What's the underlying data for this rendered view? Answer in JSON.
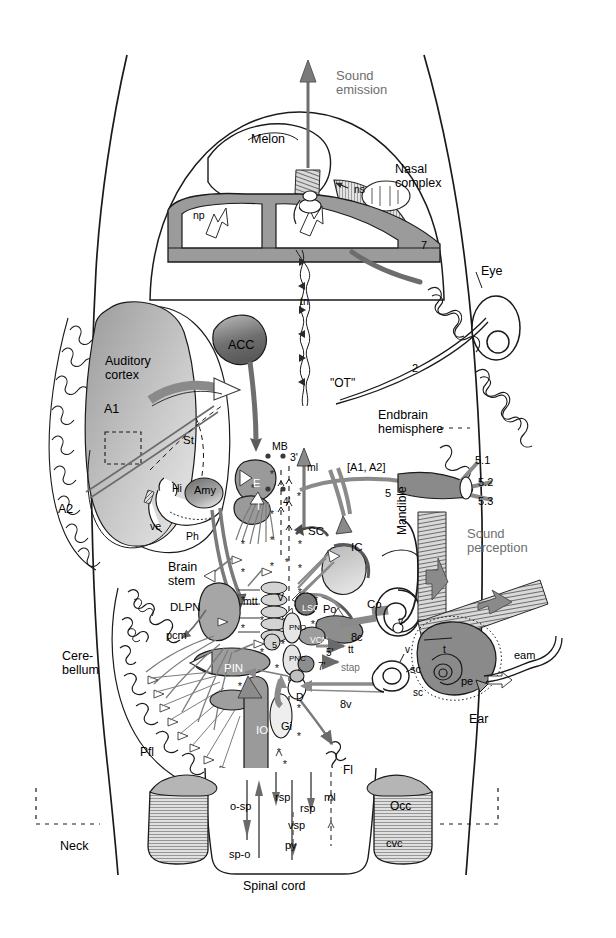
{
  "figure": {
    "domain": "diagram",
    "background_color": "#ffffff",
    "line_color": "#1a1a1a",
    "fill_mid": "#8f8f8f",
    "fill_light": "#c9c9c9",
    "fill_dark": "#5d5d5d",
    "gray_text": "#6e6e6e"
  },
  "callouts": {
    "sound_emission": "Sound\nemission",
    "sound_perception": "Sound\nperception"
  },
  "anatomy_labels": [
    {
      "id": "melon",
      "text": "Melon",
      "x": 251,
      "y": 133,
      "size": 12.5,
      "color": "#000000"
    },
    {
      "id": "nasal-complex",
      "text": "Nasal\ncomplex",
      "x": 395,
      "y": 163,
      "size": 12.5,
      "color": "#000000"
    },
    {
      "id": "ns",
      "text": "ns",
      "x": 354,
      "y": 184,
      "size": 10.5,
      "color": "#000000"
    },
    {
      "id": "np",
      "text": "np",
      "x": 193,
      "y": 210,
      "size": 10.5,
      "color": "#000000"
    },
    {
      "id": "nerve-7",
      "text": "7",
      "x": 421,
      "y": 240,
      "size": 11,
      "color": "#000000"
    },
    {
      "id": "eye",
      "text": "Eye",
      "x": 481,
      "y": 265,
      "size": 12.5,
      "color": "#000000"
    },
    {
      "id": "tn",
      "text": "tn",
      "x": 300,
      "y": 296,
      "size": 10.5,
      "color": "#000000"
    },
    {
      "id": "auditory-cortex",
      "text": "Auditory\ncortex",
      "x": 105,
      "y": 355,
      "size": 12.5,
      "color": "#000000"
    },
    {
      "id": "acc",
      "text": "ACC",
      "x": 228,
      "y": 339,
      "size": 12.5,
      "color": "#000000"
    },
    {
      "id": "a1",
      "text": "A1",
      "x": 104,
      "y": 403,
      "size": 12.5,
      "color": "#000000"
    },
    {
      "id": "st",
      "text": "St",
      "x": 183,
      "y": 434,
      "size": 11.5,
      "color": "#000000"
    },
    {
      "id": "ot",
      "text": "\"OT\"",
      "x": 330,
      "y": 377,
      "size": 12,
      "color": "#000000"
    },
    {
      "id": "nerve-2",
      "text": "2",
      "x": 412,
      "y": 363,
      "size": 11,
      "color": "#000000"
    },
    {
      "id": "endbrain",
      "text": "Endbrain\nhemisphere",
      "x": 378,
      "y": 409,
      "size": 12.5,
      "color": "#000000"
    },
    {
      "id": "a2",
      "text": "A2",
      "x": 58,
      "y": 503,
      "size": 12.5,
      "color": "#000000"
    },
    {
      "id": "hi",
      "text": "Hi",
      "x": 172,
      "y": 483,
      "size": 10.5,
      "color": "#000000"
    },
    {
      "id": "amy",
      "text": "Amy",
      "x": 194,
      "y": 485,
      "size": 11,
      "color": "#000000"
    },
    {
      "id": "ve",
      "text": "ve",
      "x": 150,
      "y": 521,
      "size": 10.5,
      "color": "#000000"
    },
    {
      "id": "ph",
      "text": "Ph",
      "x": 186,
      "y": 531,
      "size": 10.5,
      "color": "#000000"
    },
    {
      "id": "mb",
      "text": "MB",
      "x": 272,
      "y": 441,
      "size": 10.5,
      "color": "#000000"
    },
    {
      "id": "three-prime",
      "text": "3'",
      "x": 290,
      "y": 452,
      "size": 10.5,
      "color": "#000000"
    },
    {
      "id": "ml-top",
      "text": "ml",
      "x": 307,
      "y": 462,
      "size": 10.5,
      "color": "#000000"
    },
    {
      "id": "a1a2-bracket",
      "text": "[A1, A2]",
      "x": 347,
      "y": 462,
      "size": 11,
      "color": "#000000"
    },
    {
      "id": "nerve-5",
      "text": "5",
      "x": 385,
      "y": 488,
      "size": 11,
      "color": "#000000"
    },
    {
      "id": "nerve-5-1",
      "text": "5.1",
      "x": 475,
      "y": 455,
      "size": 11,
      "color": "#000000"
    },
    {
      "id": "nerve-5-2",
      "text": "5.2",
      "x": 478,
      "y": 477,
      "size": 11,
      "color": "#000000"
    },
    {
      "id": "nerve-5-3",
      "text": "5.3",
      "x": 478,
      "y": 496,
      "size": 11,
      "color": "#000000"
    },
    {
      "id": "e-nucleus",
      "text": "E",
      "x": 253,
      "y": 478,
      "size": 11,
      "color": "#ffffff"
    },
    {
      "id": "i-nucleus",
      "text": "I",
      "x": 257,
      "y": 501,
      "size": 11,
      "color": "#ffffff"
    },
    {
      "id": "four-prime",
      "text": "4'",
      "x": 283,
      "y": 497,
      "size": 10,
      "color": "#000000"
    },
    {
      "id": "sc",
      "text": "SC",
      "x": 308,
      "y": 525,
      "size": 11.5,
      "color": "#000000"
    },
    {
      "id": "ic",
      "text": "IC",
      "x": 351,
      "y": 541,
      "size": 11.5,
      "color": "#000000"
    },
    {
      "id": "mandible",
      "text": "Mandible",
      "x": 396,
      "y": 535,
      "size": 12,
      "color": "#000000",
      "rotate": -90
    },
    {
      "id": "brain-stem",
      "text": "Brain\nstem",
      "x": 168,
      "y": 561,
      "size": 12.5,
      "color": "#000000"
    },
    {
      "id": "dlpn",
      "text": "DLPN",
      "x": 170,
      "y": 601,
      "size": 11.5,
      "color": "#000000"
    },
    {
      "id": "mtt",
      "text": "mtt",
      "x": 243,
      "y": 596,
      "size": 10.5,
      "color": "#000000"
    },
    {
      "id": "v-motor",
      "text": "V",
      "x": 277,
      "y": 592,
      "size": 10.5,
      "color": "#000000"
    },
    {
      "id": "lso",
      "text": "LSO",
      "x": 302,
      "y": 604,
      "size": 9,
      "color": "#ffffff"
    },
    {
      "id": "po",
      "text": "Po",
      "x": 323,
      "y": 604,
      "size": 11,
      "color": "#000000"
    },
    {
      "id": "co",
      "text": "Co",
      "x": 367,
      "y": 598,
      "size": 11.5,
      "color": "#000000"
    },
    {
      "id": "v-small",
      "text": "v",
      "x": 398,
      "y": 617,
      "size": 10,
      "color": "#000000"
    },
    {
      "id": "pcm",
      "text": "pcm",
      "x": 166,
      "y": 630,
      "size": 11,
      "color": "#000000"
    },
    {
      "id": "eight-c",
      "text": "8c",
      "x": 351,
      "y": 632,
      "size": 11,
      "color": "#000000"
    },
    {
      "id": "vcn",
      "text": "VCN",
      "x": 310,
      "y": 636,
      "size": 8.5,
      "color": "#ffffff"
    },
    {
      "id": "pn-o",
      "text": "PNO",
      "x": 289,
      "y": 624,
      "size": 8,
      "color": "#000000"
    },
    {
      "id": "pn-c",
      "text": "PNC",
      "x": 289,
      "y": 655,
      "size": 8,
      "color": "#000000"
    },
    {
      "id": "nucleus-5",
      "text": "5",
      "x": 272,
      "y": 641,
      "size": 9,
      "color": "#000000"
    },
    {
      "id": "five-prime",
      "text": "5'",
      "x": 326,
      "y": 648,
      "size": 10,
      "color": "#000000"
    },
    {
      "id": "tt",
      "text": "tt",
      "x": 348,
      "y": 645,
      "size": 10,
      "color": "#000000"
    },
    {
      "id": "seven-prime",
      "text": "7'",
      "x": 318,
      "y": 662,
      "size": 10,
      "color": "#000000"
    },
    {
      "id": "stap",
      "text": "stap",
      "x": 341,
      "y": 663,
      "size": 10,
      "color": "#6e6e6e"
    },
    {
      "id": "cerebellum",
      "text": "Cere-\nbellum",
      "x": 62,
      "y": 650,
      "size": 12.5,
      "color": "#000000"
    },
    {
      "id": "pin",
      "text": "PIN",
      "x": 224,
      "y": 662,
      "size": 11.5,
      "color": "#ffffff"
    },
    {
      "id": "d-nucleus",
      "text": "D",
      "x": 296,
      "y": 692,
      "size": 10.5,
      "color": "#000000"
    },
    {
      "id": "eight-v",
      "text": "8v",
      "x": 340,
      "y": 699,
      "size": 11,
      "color": "#000000"
    },
    {
      "id": "sc-canal",
      "text": "sc",
      "x": 410,
      "y": 664,
      "size": 11,
      "color": "#000000"
    },
    {
      "id": "v-ear",
      "text": "v",
      "x": 405,
      "y": 645,
      "size": 10,
      "color": "#000000"
    },
    {
      "id": "t-tympanic",
      "text": "t",
      "x": 443,
      "y": 645,
      "size": 10,
      "color": "#000000"
    },
    {
      "id": "pe",
      "text": "pe",
      "x": 461,
      "y": 676,
      "size": 11,
      "color": "#000000"
    },
    {
      "id": "sc-left-ear",
      "text": "sc",
      "x": 413,
      "y": 688,
      "size": 10,
      "color": "#000000"
    },
    {
      "id": "eam",
      "text": "eam",
      "x": 514,
      "y": 650,
      "size": 11,
      "color": "#000000"
    },
    {
      "id": "ear",
      "text": "Ear",
      "x": 469,
      "y": 713,
      "size": 12.5,
      "color": "#000000"
    },
    {
      "id": "io",
      "text": "IO",
      "x": 256,
      "y": 724,
      "size": 11.5,
      "color": "#ffffff"
    },
    {
      "id": "gi",
      "text": "Gi",
      "x": 281,
      "y": 721,
      "size": 11,
      "color": "#000000"
    },
    {
      "id": "pfl",
      "text": "Pfl",
      "x": 140,
      "y": 746,
      "size": 12,
      "color": "#000000"
    },
    {
      "id": "fl",
      "text": "Fl",
      "x": 343,
      "y": 764,
      "size": 12,
      "color": "#000000"
    },
    {
      "id": "o-sp",
      "text": "o-sp",
      "x": 230,
      "y": 801,
      "size": 11,
      "color": "#000000"
    },
    {
      "id": "rsp-1",
      "text": "rsp",
      "x": 275,
      "y": 792,
      "size": 11,
      "color": "#000000"
    },
    {
      "id": "rsp-2",
      "text": "rsp",
      "x": 300,
      "y": 803,
      "size": 11,
      "color": "#000000"
    },
    {
      "id": "ml-bottom",
      "text": "ml",
      "x": 324,
      "y": 792,
      "size": 11,
      "color": "#000000"
    },
    {
      "id": "occ",
      "text": "Occ",
      "x": 390,
      "y": 800,
      "size": 12,
      "color": "#000000"
    },
    {
      "id": "vsp",
      "text": "vsp",
      "x": 288,
      "y": 820,
      "size": 11,
      "color": "#000000"
    },
    {
      "id": "py",
      "text": "py",
      "x": 285,
      "y": 840,
      "size": 11,
      "color": "#000000"
    },
    {
      "id": "sp-o",
      "text": "sp-o",
      "x": 229,
      "y": 849,
      "size": 11,
      "color": "#000000"
    },
    {
      "id": "cvc",
      "text": "cvc",
      "x": 386,
      "y": 838,
      "size": 11,
      "color": "#000000"
    },
    {
      "id": "neck",
      "text": "Neck",
      "x": 60,
      "y": 840,
      "size": 12.5,
      "color": "#000000"
    },
    {
      "id": "spinal-cord",
      "text": "Spinal cord",
      "x": 243,
      "y": 880,
      "size": 12.5,
      "color": "#000000"
    }
  ],
  "legend_notes": {
    "asterisk_meaning": "*",
    "dot_meaning": "●"
  }
}
